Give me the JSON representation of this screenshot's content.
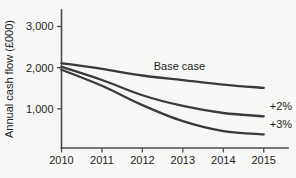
{
  "chart_data": {
    "type": "line",
    "title": "",
    "xlabel": "",
    "ylabel": "Annual cash flow (£000)",
    "x": [
      2010,
      2011,
      2012,
      2013,
      2014,
      2015
    ],
    "xtick_labels": [
      "2010",
      "2011",
      "2012",
      "2013",
      "2014",
      "2015"
    ],
    "ytick_values": [
      1000,
      2000,
      3000
    ],
    "ytick_labels": [
      "1,000",
      "2,000",
      "3,000"
    ],
    "xlim": [
      2010,
      2015.6
    ],
    "ylim": [
      50,
      3400
    ],
    "grid": false,
    "legend_position": "inline-right",
    "line_color": "#3a3a3a",
    "axis_color": "#4a4a4a",
    "background_color": "#f7f7f5",
    "series": [
      {
        "name": "Base case",
        "label": "Base case",
        "values": [
          2110,
          1970,
          1810,
          1700,
          1590,
          1510
        ]
      },
      {
        "name": "+2%",
        "label": "+2%",
        "values": [
          2020,
          1700,
          1330,
          1070,
          900,
          820
        ]
      },
      {
        "name": "+3%",
        "label": "+3%",
        "values": [
          1950,
          1560,
          1090,
          700,
          460,
          380
        ]
      }
    ],
    "annotations": [
      {
        "text": "Base case",
        "x": 2013.55,
        "y": 1800
      },
      {
        "text": "+2%",
        "x": 2015.15,
        "y": 820
      },
      {
        "text": "+3%",
        "x": 2015.15,
        "y": 380
      }
    ]
  }
}
